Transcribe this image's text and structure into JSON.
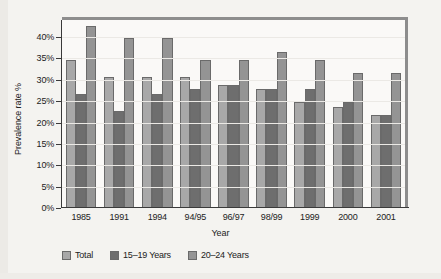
{
  "chart_data": {
    "type": "bar",
    "title": "",
    "xlabel": "Year",
    "ylabel": "Prevalence rate %",
    "ylim": [
      0,
      44
    ],
    "ytick_labels": [
      "0%",
      "5%",
      "10%",
      "15%",
      "20%",
      "25%",
      "30%",
      "35%",
      "40%"
    ],
    "ytick_values": [
      0,
      5,
      10,
      15,
      20,
      25,
      30,
      35,
      40
    ],
    "grid": true,
    "legend_position": "bottom-left",
    "categories": [
      "1985",
      "1991",
      "1994",
      "94/95",
      "96/97",
      "98/99",
      "1999",
      "2000",
      "2001"
    ],
    "series": [
      {
        "name": "Total",
        "color": "#a8a8a8",
        "values": [
          34.7,
          30.6,
          30.6,
          30.6,
          28.7,
          27.8,
          24.7,
          23.7,
          21.8
        ]
      },
      {
        "name": "15–19 Years",
        "color": "#6e6e6e",
        "values": [
          26.8,
          22.8,
          26.7,
          27.8,
          28.7,
          27.8,
          27.8,
          24.7,
          21.8
        ]
      },
      {
        "name": "20–24 Years",
        "color": "#949494",
        "values": [
          42.5,
          39.7,
          39.7,
          34.7,
          34.6,
          36.6,
          34.6,
          31.6,
          31.6
        ]
      }
    ]
  },
  "legend": {
    "items": [
      {
        "label": "Total"
      },
      {
        "label": "15–19 Years"
      },
      {
        "label": "20–24 Years"
      }
    ]
  },
  "colors": {
    "frame": "#8d8d8d",
    "axis": "#3a3a3a",
    "plot_background": "#faf9f7",
    "page_background": "#f4f3f0"
  }
}
